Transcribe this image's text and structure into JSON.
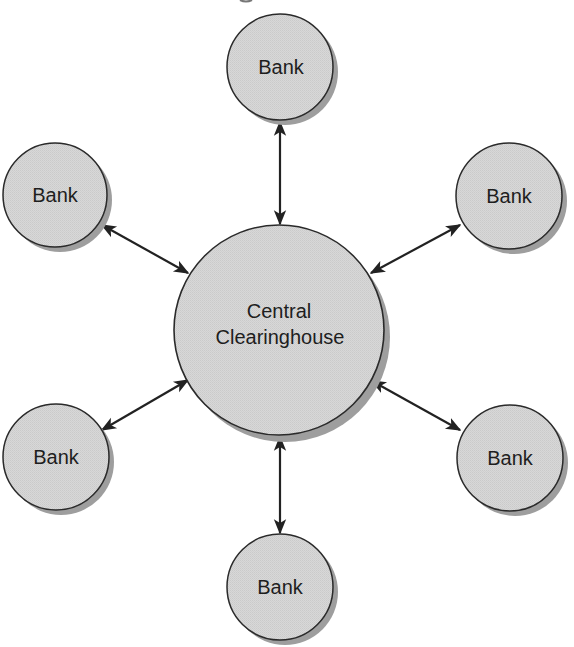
{
  "diagram": {
    "type": "hub-and-spoke",
    "colors": {
      "background": "#ffffff",
      "node_fill": "#d6d6d6",
      "node_stroke": "#2a2a2a",
      "node_shadow": "#9e9e9e",
      "arrow": "#222222",
      "text": "#1e1e1e"
    },
    "hub": {
      "label_line1": "Central",
      "label_line2": "Clearinghouse",
      "cx": 279,
      "cy": 330,
      "r": 105
    },
    "banks": [
      {
        "id": "top",
        "label": "Bank",
        "cx": 280,
        "cy": 67,
        "r": 53
      },
      {
        "id": "upper-left",
        "label": "Bank",
        "cx": 55,
        "cy": 195,
        "r": 52
      },
      {
        "id": "upper-right",
        "label": "Bank",
        "cx": 509,
        "cy": 196,
        "r": 53
      },
      {
        "id": "lower-left",
        "label": "Bank",
        "cx": 56,
        "cy": 457,
        "r": 53
      },
      {
        "id": "lower-right",
        "label": "Bank",
        "cx": 510,
        "cy": 458,
        "r": 53
      },
      {
        "id": "bottom",
        "label": "Bank",
        "cx": 280,
        "cy": 587,
        "r": 53
      }
    ],
    "connections": [
      {
        "from": "top",
        "to": "hub",
        "bidirectional": true
      },
      {
        "from": "upper-left",
        "to": "hub",
        "bidirectional": true
      },
      {
        "from": "upper-right",
        "to": "hub",
        "bidirectional": true
      },
      {
        "from": "lower-left",
        "to": "hub",
        "bidirectional": true
      },
      {
        "from": "lower-right",
        "to": "hub",
        "bidirectional": true
      },
      {
        "from": "bottom",
        "to": "hub",
        "bidirectional": true
      }
    ]
  }
}
